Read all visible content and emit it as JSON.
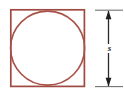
{
  "figure": {
    "type": "geometry-diagram",
    "background_color": "#ffffff",
    "shapes": {
      "square": {
        "name": "square",
        "stroke_color": "#9e4a42",
        "stroke_width": 1.6,
        "fill": "none",
        "x": 10,
        "y": 9,
        "side_px": 75
      },
      "circle": {
        "name": "inscribed-circle",
        "stroke_color": "#a85148",
        "stroke_width": 1.5,
        "fill": "none",
        "cx": 47.5,
        "cy": 46.5,
        "r": 37.5,
        "relation": "inscribed in square, tangent to all four sides"
      }
    },
    "dimension": {
      "name": "side-length-dimension",
      "label": "s",
      "label_meaning": "side length of the square",
      "line_color": "#2b2b2b",
      "line_x": 108,
      "top_y": 10,
      "bottom_y": 87,
      "arrow_heads": "both-ends",
      "extension_lines": [
        {
          "y": 10,
          "x1": 94,
          "x2": 122
        },
        {
          "y": 87,
          "x1": 94,
          "x2": 122
        }
      ],
      "extension_line_color": "#6e6e6e",
      "label_x": 108,
      "label_y": 48
    }
  }
}
